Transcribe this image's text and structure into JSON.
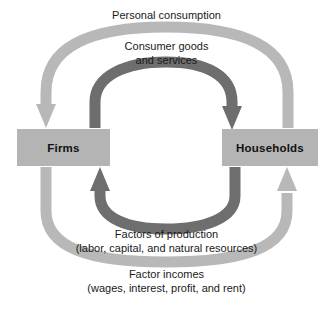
{
  "diagram": {
    "type": "circular-flow",
    "colors": {
      "outer_band": "#b8b8b8",
      "inner_band": "#6e6e6e",
      "box_fill": "#b4b4b4",
      "text": "#1a1a1a",
      "background": "#ffffff"
    },
    "boxes": [
      {
        "id": "firms",
        "label": "Firms"
      },
      {
        "id": "households",
        "label": "Households"
      }
    ],
    "flows": [
      {
        "id": "personal-consumption",
        "label": "Personal consumption",
        "band": "outer",
        "direction": "households-to-firms",
        "position": "top"
      },
      {
        "id": "consumer-goods",
        "label": "Consumer goods\nand services",
        "band": "inner",
        "direction": "firms-to-households",
        "position": "top"
      },
      {
        "id": "factors-of-production",
        "label": "Factors of production\n(labor, capital, and natural resources)",
        "band": "inner",
        "direction": "households-to-firms",
        "position": "bottom"
      },
      {
        "id": "factor-incomes",
        "label": "Factor incomes\n(wages, interest, profit, and rent)",
        "band": "outer",
        "direction": "firms-to-households",
        "position": "bottom"
      }
    ]
  }
}
